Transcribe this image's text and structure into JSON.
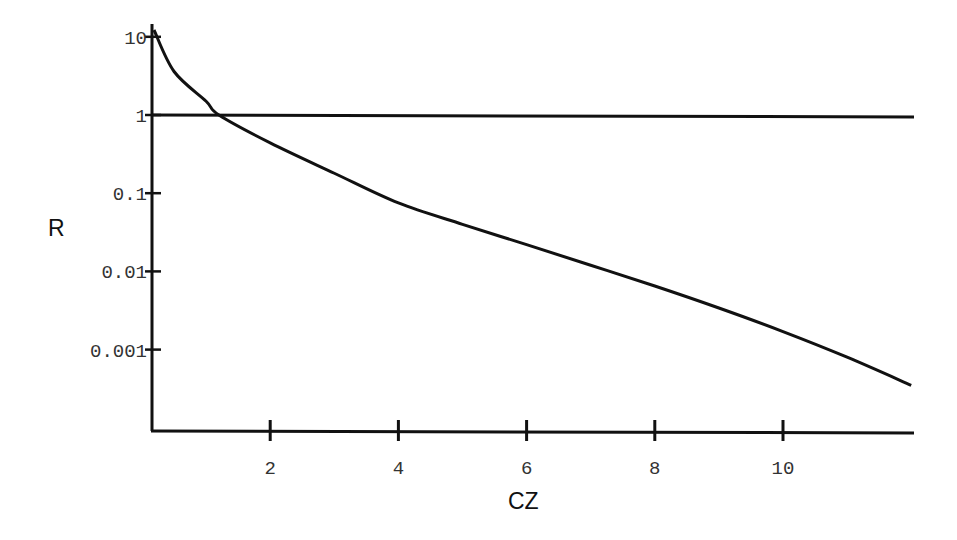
{
  "chart_data": {
    "type": "line",
    "title": "",
    "xlabel": "CZ",
    "ylabel": "R",
    "xscale": "linear",
    "yscale": "log",
    "xlim": [
      0,
      12
    ],
    "ylim": [
      0.0001,
      15
    ],
    "x_ticks": [
      2,
      4,
      6,
      8,
      10
    ],
    "x_tick_labels": [
      "2",
      "4",
      "6",
      "8",
      "10"
    ],
    "y_ticks": [
      10,
      1,
      0.1,
      0.01,
      0.001
    ],
    "y_tick_labels": [
      "10",
      "1",
      "0.1",
      "0.01",
      "0.001"
    ],
    "grid": false,
    "legend": null,
    "series": [
      {
        "name": "R(CZ)",
        "x": [
          0.15,
          0.5,
          1.0,
          1.2,
          2,
          3,
          4,
          5,
          6,
          7,
          8,
          9,
          10,
          11,
          12
        ],
        "values": [
          10,
          3.6,
          1.5,
          1.0,
          0.44,
          0.18,
          0.075,
          0.04,
          0.022,
          0.012,
          0.0065,
          0.0034,
          0.0017,
          0.0008,
          0.00035
        ]
      },
      {
        "name": "R = 1 reference",
        "x": [
          0,
          12
        ],
        "values": [
          1,
          0.95
        ]
      }
    ]
  }
}
